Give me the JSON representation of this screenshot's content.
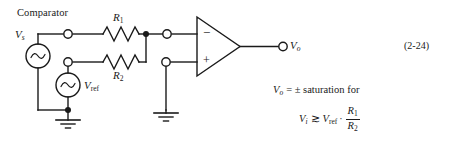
{
  "figure": {
    "title": "Comparator",
    "equation_number": "(2-24)"
  },
  "labels": {
    "source_input": "V",
    "source_input_sub": "s",
    "source_ref": "V",
    "source_ref_sub": "ref",
    "resistor_1": "R",
    "resistor_1_sub": "1",
    "resistor_2": "R",
    "resistor_2_sub": "2",
    "output": "V",
    "output_sub": "o",
    "opamp_inverting": "−",
    "opamp_noninverting": "+"
  },
  "formula": {
    "line1_var": "V",
    "line1_var_sub": "o",
    "line1_rest": "= ± saturation for",
    "line2_lhs_var": "V",
    "line2_lhs_sub": "i",
    "line2_relation": "≳",
    "line2_rhs_var": "V",
    "line2_rhs_sub": "ref",
    "line2_multiply": "·",
    "line2_frac_num": "R",
    "line2_frac_num_sub": "1",
    "line2_frac_den": "R",
    "line2_frac_den_sub": "2"
  },
  "icons": {
    "ac_source": "ac-source-icon",
    "resistor": "resistor-icon",
    "ground": "ground-icon",
    "node_dot": "junction-dot-icon",
    "terminal": "terminal-circle-icon",
    "opamp": "opamp-triangle-icon"
  },
  "colors": {
    "line": "#1a1a1a",
    "background": "#ffffff",
    "text": "#1a1a1a"
  }
}
